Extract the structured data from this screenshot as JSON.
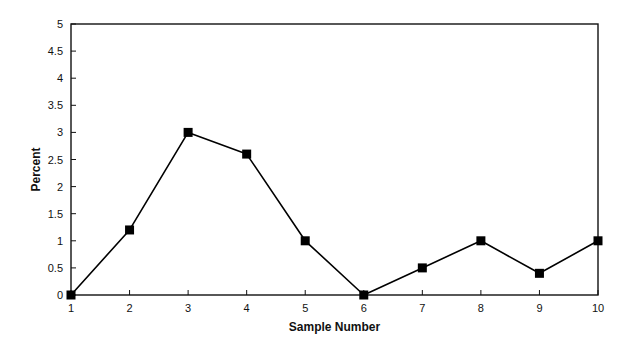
{
  "chart_data": {
    "type": "line",
    "title": "",
    "xlabel": "Sample Number",
    "ylabel": "Percent",
    "x": [
      1,
      2,
      3,
      4,
      5,
      6,
      7,
      8,
      9,
      10
    ],
    "series": [
      {
        "name": "Percent",
        "values": [
          0,
          1.2,
          3,
          2.6,
          1,
          0,
          0.5,
          1,
          0.4,
          1
        ],
        "marker": "square",
        "color": "#000000"
      }
    ],
    "xlim": [
      1,
      10
    ],
    "ylim": [
      0,
      5
    ],
    "xticks": [
      "1",
      "2",
      "3",
      "4",
      "5",
      "6",
      "7",
      "8",
      "9",
      "10"
    ],
    "yticks": [
      "0",
      "0.5",
      "1",
      "1.5",
      "2",
      "2.5",
      "3",
      "3.5",
      "4",
      "4.5",
      "5"
    ],
    "grid": false,
    "legend": "none",
    "frame": "box"
  }
}
